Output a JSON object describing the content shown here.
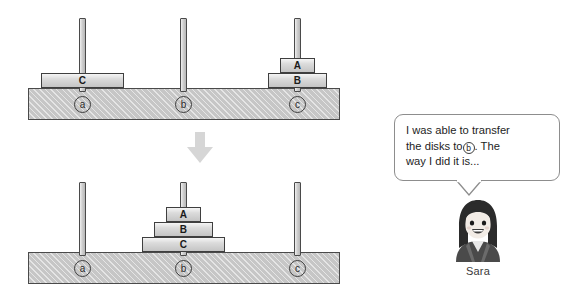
{
  "figure": {
    "type": "tower-of-hanoi-illustration",
    "background_color": "#ffffff"
  },
  "diagrams": [
    {
      "id": "before",
      "position": "top",
      "pegs": [
        {
          "label": "a",
          "disks": [
            "C"
          ]
        },
        {
          "label": "b",
          "disks": []
        },
        {
          "label": "c",
          "disks": [
            "B",
            "A"
          ]
        }
      ]
    },
    {
      "id": "after",
      "position": "bottom",
      "pegs": [
        {
          "label": "a",
          "disks": []
        },
        {
          "label": "b",
          "disks": [
            "C",
            "B",
            "A"
          ]
        },
        {
          "label": "c",
          "disks": []
        }
      ]
    }
  ],
  "disk_labels": {
    "small": "A",
    "medium": "B",
    "large": "C"
  },
  "transition": {
    "icon": "down-arrow-icon",
    "color": "#d4d4d4"
  },
  "speech": {
    "line1": "I was able to transfer",
    "line2_before": "the disks to",
    "line2_circle": "b",
    "line2_after": ". The",
    "line3": "way I did it is..."
  },
  "character": {
    "name": "Sara",
    "icon": "girl-avatar-icon"
  },
  "colors": {
    "base_fill": "#c6c6c6",
    "disk_fill": "#cfcfcf",
    "peg_fill": "#c3c3c3",
    "outline": "#3f3f3f",
    "bubble_border": "#8d8d8d"
  }
}
